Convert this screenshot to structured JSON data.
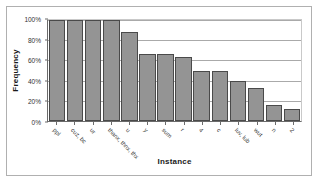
{
  "chart_data": {
    "type": "bar",
    "title": "",
    "xlabel": "Instance",
    "ylabel": "Frequency",
    "categories": [
      "ppl",
      "cuz, bc",
      "ur",
      "thanx, thnx, thx",
      "u",
      "y",
      "sum",
      "r",
      "4",
      "c",
      "luv, lub",
      "wut",
      "n",
      "2"
    ],
    "values": [
      100,
      100,
      100,
      100,
      88,
      66,
      66,
      63,
      50,
      50,
      40,
      33,
      16,
      12
    ],
    "ylim": [
      0,
      100
    ],
    "yticks": [
      0,
      20,
      40,
      60,
      80,
      100
    ],
    "ytick_labels": [
      "0%",
      "20%",
      "40%",
      "60%",
      "80%",
      "100%"
    ],
    "grid": true,
    "legend": false,
    "bar_color": "#949494",
    "bar_edge_color": "#4a4a4a",
    "gridline_color": "#aaaaaa",
    "axis_color": "#6b6b6b",
    "plot_background": "#ffffff"
  }
}
